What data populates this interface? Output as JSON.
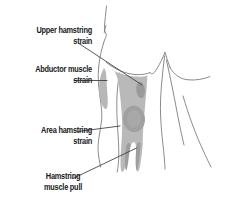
{
  "figure": {
    "type": "anatomical-diagram",
    "background_color": "#ffffff",
    "outline_color": "#7a7a7a",
    "leader_line_color": "#3c3c3c",
    "muscle_fill_color": "#b4b4b4",
    "strain_fill_color": "#969696",
    "abductor_fill_color": "#b0b0b0",
    "text_color": "#171717"
  },
  "labels": {
    "upper_hamstring_strain": {
      "line1": "Upper hamstring",
      "line2": "strain",
      "align": "right"
    },
    "abductor_muscle_strain": {
      "line1": "Abductor muscle",
      "line2": "strain",
      "align": "right"
    },
    "area_hamstring_strain": {
      "line1": "Area hamstring",
      "line2": "strain",
      "align": "right"
    },
    "hamstring_muscle_pull": {
      "line1": "Hamstring",
      "line2": "muscle pull",
      "align": "center"
    }
  },
  "regions": {
    "upper_hamstring_strain_spot": "small vertical oval near top of hamstring",
    "abductor_muscle_patch": "crescent patch on outer left thigh",
    "area_hamstring_strain_spot": "large oval mid hamstring",
    "hamstring_tendon_split": "two tendon prongs at lower hamstring"
  }
}
